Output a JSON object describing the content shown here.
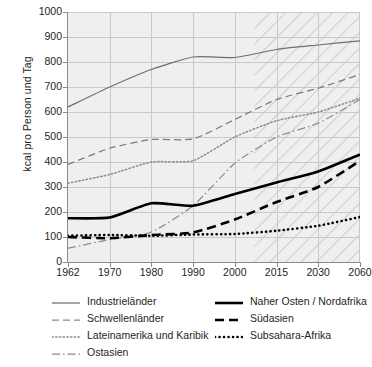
{
  "chart_data": {
    "type": "line",
    "title": "",
    "xlabel": "",
    "ylabel": "kcal pro Person und Tag",
    "ylim": [
      0,
      1000
    ],
    "yticks": [
      0,
      100,
      200,
      300,
      400,
      500,
      600,
      700,
      800,
      900,
      1000
    ],
    "xticks": [
      "1962",
      "1970",
      "1980",
      "1990",
      "2000",
      "2015",
      "2030",
      "2060"
    ],
    "x": [
      1962,
      1970,
      1980,
      1990,
      2000,
      2015,
      2030,
      2060
    ],
    "grid": true,
    "legend_position": "below",
    "projection_start": 2007,
    "projection_note": "hatched area marks projected years",
    "series": [
      {
        "name": "Industrieländer",
        "style": "solid-thin-gray",
        "color": "#6e6e6e",
        "values": [
          620,
          700,
          770,
          820,
          818,
          850,
          868,
          885
        ]
      },
      {
        "name": "Schwellenländer",
        "style": "dashed-thin-gray",
        "color": "#7a7a7a",
        "values": [
          390,
          455,
          490,
          492,
          570,
          650,
          695,
          750
        ]
      },
      {
        "name": "Lateinamerika und Karibik",
        "style": "dotted-thin-gray",
        "color": "#8c8c8c",
        "values": [
          315,
          350,
          400,
          405,
          500,
          565,
          600,
          655
        ]
      },
      {
        "name": "Ostasien",
        "style": "dashdot-thin-gray",
        "color": "#8c8c8c",
        "values": [
          55,
          90,
          120,
          225,
          395,
          500,
          555,
          650
        ]
      },
      {
        "name": "Naher Osten / Nordafrika",
        "style": "solid-thick-black",
        "color": "#000000",
        "values": [
          175,
          178,
          235,
          225,
          272,
          318,
          362,
          430
        ]
      },
      {
        "name": "Südasien",
        "style": "dashed-thick-black",
        "color": "#000000",
        "values": [
          100,
          95,
          108,
          118,
          170,
          240,
          300,
          405
        ]
      },
      {
        "name": "Subsahara-Afrika",
        "style": "dotted-thick-black",
        "color": "#000000",
        "values": [
          105,
          108,
          105,
          110,
          112,
          125,
          145,
          180
        ]
      }
    ]
  },
  "axis": {
    "y_label": "kcal pro Person und Tag",
    "y_ticks": [
      "1000",
      "900",
      "800",
      "700",
      "600",
      "500",
      "400",
      "300",
      "200",
      "100",
      "0"
    ],
    "x_ticks": [
      "1962",
      "1970",
      "1980",
      "1990",
      "2000",
      "2015",
      "2030",
      "2060"
    ]
  },
  "legend": {
    "left": [
      {
        "label": "Industrieländer",
        "swatch": "solid-thin-gray"
      },
      {
        "label": "Schwellenländer",
        "swatch": "dashed-thin-gray"
      },
      {
        "label": "Lateinamerika und Karibik",
        "swatch": "dotted-thin-gray"
      },
      {
        "label": "Ostasien",
        "swatch": "dashdot-thin-gray"
      }
    ],
    "right": [
      {
        "label": "Naher Osten / Nordafrika",
        "swatch": "solid-thick-black"
      },
      {
        "label": "Südasien",
        "swatch": "dashed-thick-black"
      },
      {
        "label": "Subsahara-Afrika",
        "swatch": "dotted-thick-black"
      }
    ]
  },
  "colors": {
    "plot_background": "#efefef",
    "grid": "#c9c9c9",
    "axis": "#8a8a8a",
    "text": "#231f20",
    "accent_black": "#000000",
    "accent_gray": "#6e6e6e"
  }
}
